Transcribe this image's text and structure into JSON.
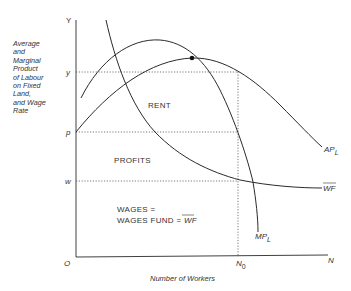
{
  "diagram": {
    "y_axis_label_lines": [
      "Average",
      "and",
      "Marginal",
      "Product",
      "of Labour",
      "on Fixed",
      "Land,",
      "and Wage",
      "Rate"
    ],
    "x_axis_label": "Number of Workers",
    "axis_end_y": "Y",
    "axis_end_x": "N",
    "origin": "O",
    "ticks_y": {
      "y": "y",
      "p": "p",
      "w": "w"
    },
    "tick_x": {
      "base": "N",
      "sub": "0"
    },
    "regions": {
      "rent": "RENT",
      "profits": "PROFITS",
      "wages_line1": "WAGES =",
      "wages_line2": "WAGES FUND = ",
      "wages_wf": "WF"
    },
    "curves": {
      "ap": {
        "base": "AP",
        "sub": "L"
      },
      "mp": {
        "base": "MP",
        "sub": "L"
      },
      "wf": "WF"
    },
    "colors": {
      "line": "#2a2a2a",
      "dotted": "#555555",
      "text": "#333333"
    }
  }
}
